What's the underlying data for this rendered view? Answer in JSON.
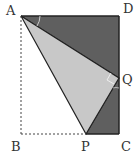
{
  "diagram": {
    "type": "geometry-fold",
    "points": {
      "A": {
        "label": "A",
        "x": 21,
        "y": 16
      },
      "D": {
        "label": "D",
        "x": 119,
        "y": 16
      },
      "Q": {
        "label": "Q",
        "x": 119,
        "y": 78
      },
      "C": {
        "label": "C",
        "x": 119,
        "y": 134
      },
      "P": {
        "label": "P",
        "x": 86,
        "y": 134
      },
      "B": {
        "label": "B",
        "x": 21,
        "y": 134
      }
    },
    "colors": {
      "dark_fill": "#5f5f5f",
      "light_fill": "#c8c8c8",
      "stroke": "#222222",
      "dashed": "#444444"
    }
  }
}
